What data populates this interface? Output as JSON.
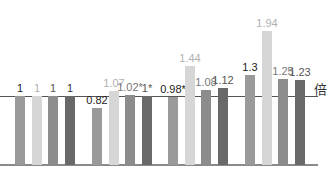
{
  "chart_data": {
    "type": "bar",
    "title": "",
    "xlabel": "",
    "ylabel": "",
    "unit_label": "倍",
    "reference_line": 1,
    "ylim": [
      0,
      2.0
    ],
    "grid": false,
    "legend": null,
    "categories": [
      "Group 1",
      "Group 2",
      "Group 3",
      "Group 4"
    ],
    "series": [
      {
        "name": "Series 1",
        "color": "#9a9a9a",
        "values": [
          1,
          0.82,
          0.98,
          1.3
        ],
        "labels": [
          "1",
          "0.82",
          "0.98*",
          "1.3"
        ],
        "label_colors": [
          "#222222",
          "#222222",
          "#222222",
          "#222222"
        ]
      },
      {
        "name": "Series 2",
        "color": "#d6d6d6",
        "values": [
          1,
          1.07,
          1.44,
          1.94
        ],
        "labels": [
          "1",
          "1.07",
          "1.44",
          "1.94"
        ],
        "label_colors": [
          "#b0b0b0",
          "#b0b0b0",
          "#b0b0b0",
          "#b0b0b0"
        ]
      },
      {
        "name": "Series 3",
        "color": "#8c8c8c",
        "values": [
          1,
          1.02,
          1.08,
          1.25
        ],
        "labels": [
          "1",
          "1.02*",
          "1.08",
          "1.25"
        ],
        "label_colors": [
          "#555555",
          "#777777",
          "#777777",
          "#777777"
        ]
      },
      {
        "name": "Series 4",
        "color": "#696969",
        "values": [
          1,
          1,
          1.12,
          1.23
        ],
        "labels": [
          "1",
          "1*",
          "1.12",
          "1.23"
        ],
        "label_colors": [
          "#333333",
          "#555555",
          "#555555",
          "#555555"
        ]
      }
    ]
  }
}
